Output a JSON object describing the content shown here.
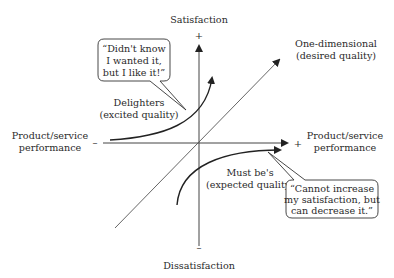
{
  "diagram": {
    "axes": {
      "vertical": {
        "top_label": "Satisfaction",
        "bottom_label": "Dissatisfaction",
        "top_sign": "+",
        "bottom_sign": "–"
      },
      "horizontal": {
        "left_label_line1": "Product/service",
        "left_label_line2": "performance",
        "right_label_line1": "Product/service",
        "right_label_line2": "performance",
        "left_sign": "–",
        "right_sign": "+"
      }
    },
    "curves": {
      "one_dimensional": {
        "line1": "One-dimensional",
        "line2": "(desired quality)"
      },
      "delighters": {
        "line1": "Delighters",
        "line2": "(excited quality)"
      },
      "must_be": {
        "line1": "Must be's",
        "line2": "(expected quality)"
      }
    },
    "callouts": {
      "delighters": {
        "line1": "“Didn't know",
        "line2": "I wanted it,",
        "line3": "but I like it!”"
      },
      "must_be": {
        "line1": "“Cannot increase",
        "line2": "my satisfaction, but",
        "line3": "can decrease it.”"
      }
    },
    "colors": {
      "line": "#3a3a3a",
      "text": "#2a2a2a",
      "background": "#ffffff"
    }
  }
}
